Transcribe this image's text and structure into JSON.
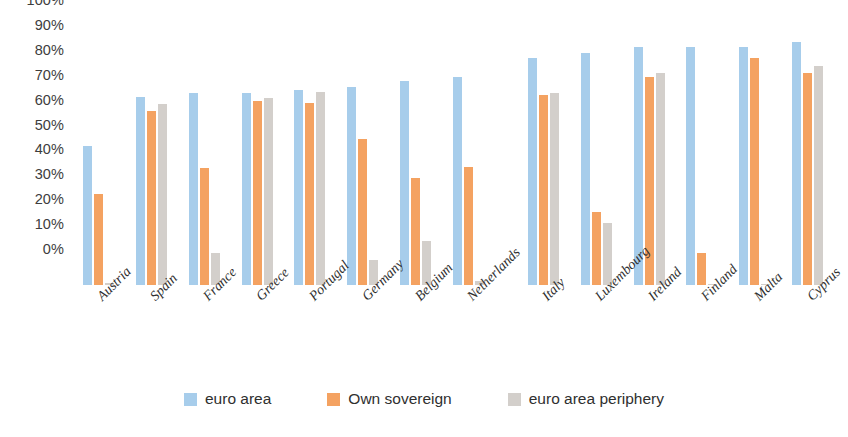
{
  "chart_data": {
    "type": "bar",
    "title": "",
    "subtitle": "",
    "xlabel": "",
    "ylabel": "",
    "ylim": [
      0,
      100
    ],
    "y_tick_labels": [
      "100%",
      "90%",
      "80%",
      "70%",
      "60%",
      "50%",
      "40%",
      "30%",
      "20%",
      "10%",
      "0%"
    ],
    "y_tick_values": [
      100,
      90,
      80,
      70,
      60,
      50,
      40,
      30,
      20,
      10,
      0
    ],
    "grid": false,
    "legend_position": "bottom-center",
    "categories": [
      "Austria",
      "Spain",
      "France",
      "Greece",
      "Portugal",
      "Germany",
      "Belgium",
      "Netherlands",
      "Italy",
      "Luxembourg",
      "Ireland",
      "Finland",
      "Malta",
      "Cyprus"
    ],
    "group_gap_before": [
      "Italy"
    ],
    "series": [
      {
        "name": "euro area",
        "color": "#a7cdeb",
        "values": [
          56,
          75.5,
          77,
          77,
          78.5,
          79.5,
          82,
          83.5,
          91,
          93,
          95.5,
          95.5,
          95.5,
          97.5
        ]
      },
      {
        "name": "Own sovereign",
        "color": "#f4a261",
        "values": [
          36.5,
          70,
          47,
          74,
          73,
          58.5,
          43,
          47.5,
          76.5,
          29.5,
          83.5,
          13,
          91,
          85
        ]
      },
      {
        "name": "euro area periphery",
        "color": "#d3cfcb",
        "values": [
          1,
          72.5,
          13,
          75,
          77.5,
          10,
          17.5,
          1.5,
          77,
          25,
          85,
          0,
          0.5,
          88
        ]
      }
    ]
  },
  "legend": {
    "items": [
      {
        "label": "euro area",
        "swatch": "legend-swatch-euro-area"
      },
      {
        "label": "Own sovereign",
        "swatch": "legend-swatch-own-sovereign"
      },
      {
        "label": "euro area periphery",
        "swatch": "legend-swatch-euro-area-periphery"
      }
    ]
  },
  "colors": {
    "series_euro_area": "#a7cdeb",
    "series_own_sovereign": "#f4a261",
    "series_euro_area_periphery": "#d3cfcb",
    "text": "#3d3d3d",
    "background": "#ffffff"
  }
}
